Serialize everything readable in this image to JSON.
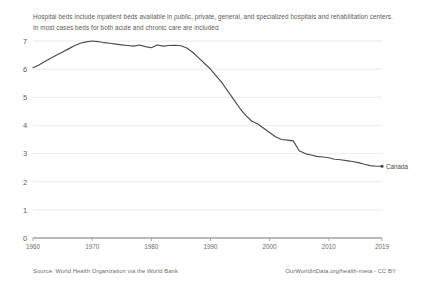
{
  "subtitle": "Hospital beds include inpatient beds available in public, private, general, and specialized hospitals and rehabilitation centers. In most cases beds for both acute and chronic care are included.",
  "footer": {
    "source": "Source: World Health Organization via the World Bank",
    "credit": "OurWorldInData.org/health-meta - CC BY"
  },
  "chart_data": {
    "type": "line",
    "title": "",
    "subtitle": "Hospital beds include inpatient beds available in public, private, general, and specialized hospitals and rehabilitation centers. In most cases beds for both acute and chronic care are included.",
    "xlabel": "",
    "ylabel": "",
    "xlim": [
      1960,
      2019
    ],
    "ylim": [
      0,
      7
    ],
    "grid": true,
    "legend_position": "right-end-label",
    "y_ticks": [
      0,
      1,
      2,
      3,
      4,
      5,
      6,
      7
    ],
    "x_ticks": [
      1960,
      1970,
      1980,
      1990,
      2000,
      2010,
      2019
    ],
    "line_color": "#4a4a4a",
    "grid_color": "#e3e3e3",
    "series": [
      {
        "name": "Canada",
        "x": [
          1960,
          1961,
          1962,
          1963,
          1964,
          1965,
          1966,
          1967,
          1968,
          1969,
          1970,
          1971,
          1972,
          1973,
          1974,
          1975,
          1976,
          1977,
          1978,
          1979,
          1980,
          1981,
          1982,
          1983,
          1984,
          1985,
          1986,
          1987,
          1988,
          1989,
          1990,
          1991,
          1992,
          1993,
          1994,
          1995,
          1996,
          1997,
          1998,
          1999,
          2000,
          2001,
          2002,
          2003,
          2004,
          2005,
          2006,
          2007,
          2008,
          2009,
          2010,
          2011,
          2012,
          2013,
          2014,
          2015,
          2016,
          2017,
          2018,
          2019
        ],
        "values": [
          6.05,
          6.15,
          6.27,
          6.39,
          6.5,
          6.61,
          6.72,
          6.83,
          6.92,
          6.97,
          7.0,
          6.98,
          6.94,
          6.92,
          6.89,
          6.86,
          6.84,
          6.82,
          6.86,
          6.8,
          6.76,
          6.86,
          6.82,
          6.84,
          6.85,
          6.83,
          6.75,
          6.6,
          6.4,
          6.2,
          6.0,
          5.75,
          5.5,
          5.2,
          4.9,
          4.6,
          4.35,
          4.15,
          4.05,
          3.9,
          3.75,
          3.6,
          3.5,
          3.48,
          3.45,
          3.1,
          3.0,
          2.95,
          2.9,
          2.88,
          2.85,
          2.8,
          2.78,
          2.75,
          2.72,
          2.68,
          2.62,
          2.57,
          2.55,
          2.55
        ]
      }
    ]
  }
}
